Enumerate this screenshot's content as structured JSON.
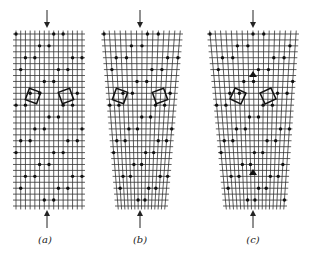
{
  "figure": {
    "line_color": "#333333",
    "dot_color": "#111111",
    "background": "#ffffff"
  },
  "panels": [
    {
      "id": "a",
      "label": "(a)",
      "label_x": 45,
      "label_y": 234,
      "grid": {
        "top_left": 16,
        "top_right": 82,
        "bottom_left": 16,
        "bottom_right": 82,
        "top": 34,
        "bottom": 206,
        "cols": 15,
        "rows": 30
      },
      "arrow_x": 47,
      "arrow_top": [
        10,
        28
      ],
      "arrow_bottom": [
        210,
        228
      ],
      "squares": [
        {
          "cx": 33,
          "cy": 96,
          "size": 12,
          "rot": 20
        },
        {
          "cx": 66,
          "cy": 96,
          "size": 12,
          "rot": -20
        }
      ],
      "dislocations": []
    },
    {
      "id": "b",
      "label": "(b)",
      "label_x": 140,
      "label_y": 234,
      "grid": {
        "top_left": 104,
        "top_right": 180,
        "bottom_left": 118,
        "bottom_right": 165,
        "top": 34,
        "bottom": 206,
        "cols": 15,
        "rows": 30
      },
      "arrow_x": 140,
      "arrow_top": [
        10,
        28
      ],
      "arrow_bottom": [
        210,
        228
      ],
      "squares": [
        {
          "cx": 120,
          "cy": 96,
          "size": 12,
          "rot": 20
        },
        {
          "cx": 160,
          "cy": 96,
          "size": 12,
          "rot": -20
        }
      ],
      "dislocations": []
    },
    {
      "id": "c",
      "label": "(c)",
      "label_x": 253,
      "label_y": 234,
      "grid": {
        "top_left": 210,
        "top_right": 296,
        "bottom_left": 226,
        "bottom_right": 284,
        "top": 34,
        "bottom": 206,
        "cols": 17,
        "rows": 30
      },
      "arrow_x": 253,
      "arrow_top": [
        10,
        28
      ],
      "arrow_bottom": [
        210,
        228
      ],
      "squares": [
        {
          "cx": 238,
          "cy": 96,
          "size": 12,
          "rot": 25
        },
        {
          "cx": 268,
          "cy": 96,
          "size": 12,
          "rot": -25
        }
      ],
      "dislocations": [
        {
          "x": 253,
          "y": 74
        },
        {
          "x": 253,
          "y": 172
        }
      ]
    }
  ]
}
